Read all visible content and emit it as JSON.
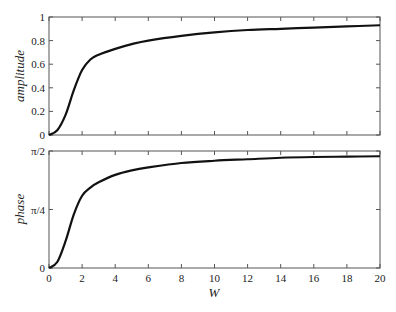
{
  "chart_data": [
    {
      "type": "line",
      "title": "",
      "xlabel": "",
      "ylabel": "amplitude",
      "xlim": [
        0,
        20
      ],
      "ylim": [
        0,
        1
      ],
      "xticks": [
        0,
        2,
        4,
        6,
        8,
        10,
        12,
        14,
        16,
        18,
        20
      ],
      "yticks": [
        0,
        0.2,
        0.4,
        0.6,
        0.8,
        1
      ],
      "ytick_labels": [
        "0",
        "0.2",
        "0.4",
        "0.6",
        "0.8",
        "1"
      ],
      "grid": false,
      "series": [
        {
          "name": "amplitude",
          "x": [
            0,
            0.5,
            1,
            1.5,
            2,
            2.5,
            3,
            4,
            5,
            6,
            8,
            10,
            12,
            14,
            16,
            18,
            20
          ],
          "y": [
            0,
            0.04,
            0.17,
            0.38,
            0.55,
            0.64,
            0.68,
            0.73,
            0.77,
            0.8,
            0.84,
            0.87,
            0.89,
            0.9,
            0.91,
            0.92,
            0.93
          ]
        }
      ]
    },
    {
      "type": "line",
      "title": "",
      "xlabel": "W",
      "ylabel": "phase",
      "xlim": [
        0,
        20
      ],
      "ylim": [
        0,
        1.5708
      ],
      "xticks": [
        0,
        2,
        4,
        6,
        8,
        10,
        12,
        14,
        16,
        18,
        20
      ],
      "xtick_labels": [
        "0",
        "2",
        "4",
        "6",
        "8",
        "10",
        "12",
        "14",
        "16",
        "18",
        "20"
      ],
      "yticks": [
        0,
        0.7854,
        1.5708
      ],
      "ytick_labels": [
        "0",
        "π/4",
        "π/2"
      ],
      "grid": false,
      "series": [
        {
          "name": "phase",
          "x": [
            0,
            0.5,
            1,
            1.5,
            2,
            2.5,
            3,
            4,
            5,
            6,
            8,
            10,
            12,
            14,
            16,
            18,
            20
          ],
          "y": [
            0,
            0.08,
            0.36,
            0.72,
            0.97,
            1.08,
            1.15,
            1.25,
            1.31,
            1.35,
            1.41,
            1.44,
            1.46,
            1.48,
            1.49,
            1.495,
            1.5
          ]
        }
      ]
    }
  ]
}
